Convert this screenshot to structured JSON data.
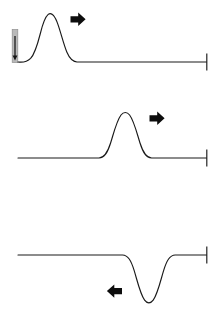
{
  "figure": {
    "width": 221,
    "height": 323,
    "background_color": "#ffffff",
    "trace_color": "#1a1a1a",
    "arrow_color": "#0d0d0d",
    "marker_color": "#b9b9b9"
  },
  "panels": [
    {
      "id": "panel-top",
      "name": "top-trace",
      "baseline_y": 62,
      "trace_start_x": 22,
      "trace_end_x": 207,
      "peak": {
        "x": 48,
        "y": 14,
        "polarity": "positive"
      },
      "pulse_span": {
        "start_x": 22,
        "end_x": 80
      },
      "shape": "asymmetric-rising-pulse",
      "arrow": {
        "direction": "right",
        "glyph": "➤",
        "x": 79,
        "y": 19,
        "name": "propagation-arrow-right"
      },
      "stimulus_marker": {
        "present": true,
        "x": 15,
        "top_y": 30,
        "bottom_y": 62,
        "name": "stimulus-marker"
      },
      "end_tick": {
        "x": 207,
        "top_y": 54,
        "bottom_y": 70
      }
    },
    {
      "id": "panel-middle",
      "name": "middle-trace",
      "baseline_y": 158,
      "trace_start_x": 18,
      "trace_end_x": 207,
      "peak": {
        "x": 125,
        "y": 113,
        "polarity": "positive"
      },
      "pulse_span": {
        "start_x": 100,
        "end_x": 150
      },
      "shape": "symmetric-positive-bump",
      "arrow": {
        "direction": "right",
        "glyph": "➤",
        "x": 158,
        "y": 118,
        "name": "propagation-arrow-right"
      },
      "stimulus_marker": {
        "present": false
      },
      "end_tick": {
        "x": 207,
        "top_y": 150,
        "bottom_y": 166
      }
    },
    {
      "id": "panel-bottom",
      "name": "bottom-trace",
      "baseline_y": 255,
      "trace_start_x": 18,
      "trace_end_x": 207,
      "peak": {
        "x": 148,
        "y": 303,
        "polarity": "negative"
      },
      "pulse_span": {
        "start_x": 124,
        "end_x": 173
      },
      "shape": "symmetric-negative-dip",
      "arrow": {
        "direction": "left",
        "glyph": "➤",
        "x": 112,
        "y": 291,
        "name": "propagation-arrow-left"
      },
      "stimulus_marker": {
        "present": false
      },
      "end_tick": {
        "x": 207,
        "top_y": 247,
        "bottom_y": 263
      }
    }
  ],
  "caption": {
    "clipped_line": "",
    "visible": false,
    "note": "text clipped at bottom edge, illegible"
  }
}
